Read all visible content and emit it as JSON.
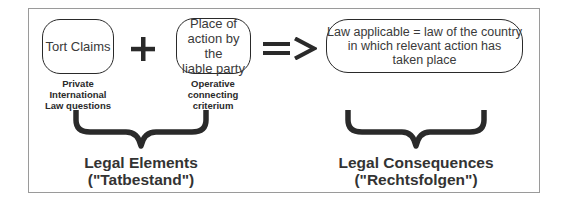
{
  "diagram": {
    "elements": [
      {
        "id": "tort-claims",
        "text": "Tort Claims",
        "caption": [
          "Private",
          "International",
          "Law questions"
        ]
      },
      {
        "id": "place-of-action",
        "text": [
          "Place of",
          "action by the",
          "liable party"
        ],
        "caption": [
          "Operative",
          "connecting",
          "criterium"
        ]
      }
    ],
    "operators": {
      "plus": "+",
      "implies": "=>"
    },
    "result": {
      "text": [
        "Law applicable = law of the country",
        "in which relevant action has",
        "taken place"
      ]
    },
    "groups": [
      {
        "title": "Legal Elements",
        "subtitle": "(\"Tatbestand\")"
      },
      {
        "title": "Legal Consequences",
        "subtitle": "(\"Rechtsfolgen\")"
      }
    ]
  },
  "colors": {
    "stroke": "#2a2a2a",
    "frame": "#9a9a9a",
    "background": "#ffffff"
  }
}
